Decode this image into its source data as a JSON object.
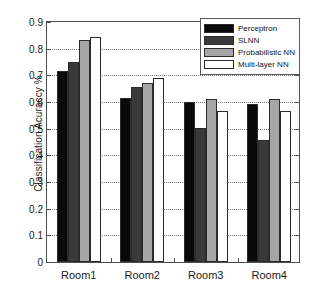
{
  "chart_data": {
    "type": "bar",
    "title": "",
    "xlabel": "",
    "ylabel": "Classification Acuraccy %",
    "categories": [
      "Room1",
      "Room2",
      "Room3",
      "Room4"
    ],
    "series": [
      {
        "name": "Perceptron",
        "color": "#0a0a0a",
        "values": [
          0.712,
          0.61,
          0.595,
          0.588
        ]
      },
      {
        "name": "SLNN",
        "color": "#3a3a3a",
        "values": [
          0.745,
          0.65,
          0.498,
          0.452
        ]
      },
      {
        "name": "Probabilistic NN",
        "color": "#a6a6a6",
        "values": [
          0.826,
          0.666,
          0.608,
          0.605
        ]
      },
      {
        "name": "Multi-layer NN",
        "color": "#ffffff",
        "values": [
          0.835,
          0.683,
          0.563,
          0.563
        ]
      }
    ],
    "ylim": [
      0,
      0.9
    ],
    "ytick_labels": [
      "0",
      "0.1",
      "0.2",
      "0.3",
      "0.4",
      "0.5",
      "0.6",
      "0.7",
      "0.8",
      "0.9"
    ],
    "ytick_values": [
      0,
      0.1,
      0.2,
      0.3,
      0.4,
      0.5,
      0.6,
      0.7,
      0.8,
      0.9
    ],
    "grid": true,
    "legend_position": "top-right"
  }
}
